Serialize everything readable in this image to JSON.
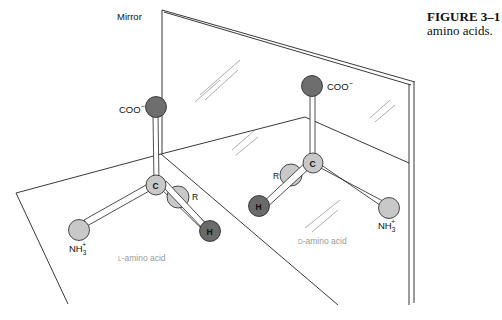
{
  "figure": {
    "number_label": "FIGURE 3–1",
    "caption_text": "amino acids."
  },
  "mirror": {
    "label": "Mirror"
  },
  "left_molecule": {
    "name": "L-amino acid",
    "name_prefix": "L",
    "name_rest": "-amino acid",
    "carbon": "C",
    "carboxyl": "COO",
    "carboxyl_charge": "−",
    "amino": "NH",
    "amino_sub": "3",
    "amino_sup": "+",
    "r_group": "R",
    "hydrogen": "H"
  },
  "right_molecule": {
    "name": "D-amino acid",
    "name_prefix": "D",
    "name_rest": "-amino acid",
    "carbon": "C",
    "carboxyl": "COO",
    "carboxyl_charge": "−",
    "amino": "NH",
    "amino_sub": "3",
    "amino_sup": "+",
    "r_group": "R",
    "hydrogen": "H"
  },
  "colors": {
    "carboxyl_atom": "#6e6e6e",
    "hydrogen_atom": "#6a6a6a",
    "light_atom": "#c8c8c8",
    "line": "#222222"
  }
}
